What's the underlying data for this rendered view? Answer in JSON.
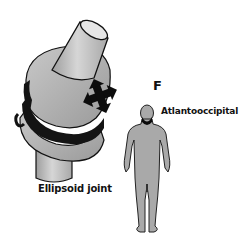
{
  "figure": {
    "panel_letter": "F",
    "joint_type_label": "Ellipsoid joint",
    "example_label": "Atlantooccipital",
    "colors": {
      "bone_fill": "#bdbdbd",
      "bone_light": "#d9d9d9",
      "outline": "#111111",
      "ligament": "#141414",
      "motion_arrows": "#0d0d0d",
      "figure_fill": "#a9a9a9",
      "highlight": "#0a0a0a",
      "background": "#ffffff"
    },
    "icons": {
      "motion_arrows": "four-way-arrow-icon",
      "human_figure": "human-body-silhouette"
    }
  }
}
